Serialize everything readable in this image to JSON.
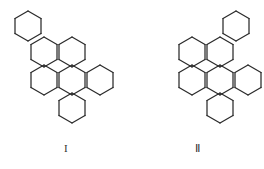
{
  "page": {
    "background_color": "#ffffff",
    "line_color": "#2b2b2b",
    "label_color": "#333333",
    "width": 264,
    "height": 169
  },
  "figures": [
    {
      "id": "I",
      "label": "I",
      "name": "structure-I",
      "ring_count": 7,
      "hex_orientation": "pointy-top",
      "hex_width": 26,
      "hex_height": 30,
      "description": "Seven fused six-membered rings arranged as a stepped benzenoid cluster descending from upper-left to lower-right.",
      "ring_centers": [
        [
          28,
          26
        ],
        [
          44,
          52
        ],
        [
          72,
          52
        ],
        [
          44,
          80
        ],
        [
          72,
          80
        ],
        [
          100,
          80
        ],
        [
          72,
          108
        ]
      ]
    },
    {
      "id": "II",
      "label": "Ⅱ",
      "name": "structure-II",
      "ring_count": 7,
      "hex_orientation": "pointy-top",
      "hex_width": 26,
      "hex_height": 30,
      "description": "Seven fused six-membered rings arranged as a stepped benzenoid cluster with the terminal ring at upper-right, the approximate mirror image of structure I.",
      "ring_centers": [
        [
          104,
          26
        ],
        [
          60,
          52
        ],
        [
          88,
          52
        ],
        [
          60,
          80
        ],
        [
          88,
          80
        ],
        [
          116,
          80
        ],
        [
          88,
          108
        ]
      ]
    }
  ]
}
